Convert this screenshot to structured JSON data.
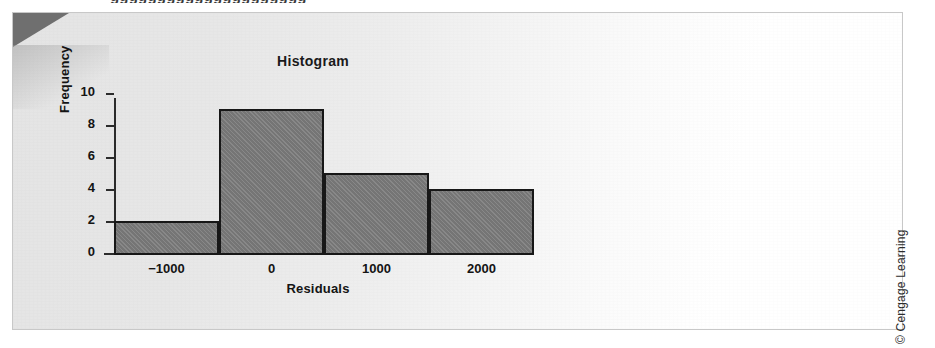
{
  "page": {
    "cutoff_text_above_figure": "ggggggggggggggggggggg",
    "credit": "© Cengage Learning"
  },
  "chart_data": {
    "type": "bar",
    "title": "Histogram",
    "xlabel": "Residuals",
    "ylabel": "Frequency",
    "categories": [
      "-1500 to -500",
      "-500 to 500",
      "500 to 1500",
      "1500 to 2500"
    ],
    "bin_edges": [
      -1500,
      -500,
      500,
      1500,
      2500
    ],
    "values": [
      2,
      9,
      5,
      4
    ],
    "xlim": [
      -1500,
      2500
    ],
    "ylim": [
      0,
      10
    ],
    "x_tick_values": [
      -1000,
      0,
      1000,
      2000
    ],
    "x_tick_labels": [
      "−1000",
      "0",
      "1000",
      "2000"
    ],
    "y_tick_values": [
      0,
      2,
      4,
      6,
      8,
      10
    ],
    "y_tick_labels": [
      "0",
      "2",
      "4",
      "6",
      "8",
      "10"
    ],
    "grid": false,
    "legend": false,
    "bar_fill_color": "#7b7b7b",
    "bar_border_color": "#171717",
    "axis_color": "#2b2b2b",
    "text_color": "#141414"
  }
}
